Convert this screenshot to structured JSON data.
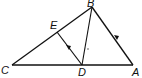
{
  "diagram": {
    "type": "geometry-triangle",
    "points": {
      "A": {
        "label": "A",
        "x": 133,
        "y": 65
      },
      "B": {
        "label": "B",
        "x": 92,
        "y": 7
      },
      "C": {
        "label": "C",
        "x": 12,
        "y": 65
      },
      "D": {
        "label": "D",
        "x": 82,
        "y": 65
      },
      "E": {
        "label": "E",
        "x": 57,
        "y": 32
      }
    },
    "segments": [
      "CB",
      "BA",
      "CA",
      "BD",
      "DE"
    ],
    "parallel_marks": [
      "DE",
      "AB"
    ],
    "line_color": "#111111"
  }
}
